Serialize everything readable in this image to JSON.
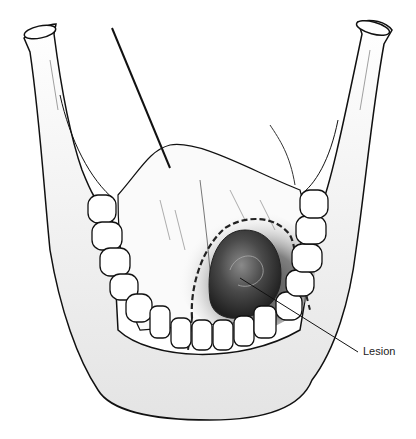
{
  "figure": {
    "labels": [
      {
        "text": "Lesion",
        "x": 363,
        "y": 345
      }
    ]
  },
  "colors": {
    "line": "#111111",
    "shade_dark": "#3a3a3a",
    "shade_mid": "#9a9a9a",
    "bone": "#f3f3f3",
    "background": "#ffffff"
  }
}
